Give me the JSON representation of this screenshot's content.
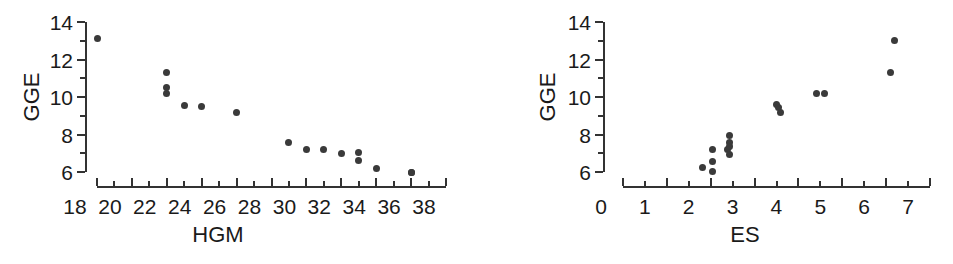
{
  "figure": {
    "background_color": "#ffffff",
    "marker_color": "#3a3a3a",
    "axis_color": "#333333"
  },
  "chart_data": [
    {
      "type": "scatter",
      "panel": "left",
      "title": "",
      "xlabel": "HGM",
      "ylabel": "GGE",
      "xlim": [
        17.2,
        39.0
      ],
      "ylim": [
        5.4,
        14.3
      ],
      "xticks": [
        18,
        20,
        22,
        24,
        26,
        28,
        30,
        32,
        34,
        36,
        38
      ],
      "xtick_labels": [
        "18",
        "20",
        "22",
        "24",
        "26",
        "28",
        "30",
        "32",
        "34",
        "36",
        "38"
      ],
      "xminor_step": 1,
      "yticks": [
        6,
        8,
        10,
        12,
        14
      ],
      "ytick_labels": [
        "6",
        "8",
        "10",
        "12",
        "14"
      ],
      "yminor_step": 1,
      "grid": false,
      "legend": "none",
      "n_points": 16,
      "x": [
        18.0,
        22.0,
        22.0,
        22.0,
        23.0,
        24.0,
        26.0,
        29.0,
        30.0,
        31.0,
        32.0,
        33.0,
        33.0,
        34.0,
        36.0,
        36.0
      ],
      "y": [
        13.1,
        11.3,
        10.5,
        10.2,
        9.55,
        9.5,
        9.15,
        7.55,
        7.2,
        7.2,
        7.0,
        7.05,
        6.6,
        6.2,
        6.0,
        6.0
      ]
    },
    {
      "type": "scatter",
      "panel": "right",
      "title": "",
      "xlabel": "ES",
      "ylabel": "GGE",
      "xlim": [
        -0.2,
        7.3
      ],
      "ylim": [
        5.4,
        14.3
      ],
      "xticks": [
        0,
        1,
        2,
        3,
        4,
        5,
        6,
        7
      ],
      "xtick_labels": [
        "0",
        "1",
        "2",
        "3",
        "4",
        "5",
        "6",
        "7"
      ],
      "xminor_step": 0.5,
      "yticks": [
        6,
        8,
        10,
        12,
        14
      ],
      "ytick_labels": [
        "6",
        "8",
        "10",
        "12",
        "14"
      ],
      "yminor_step": 1,
      "grid": false,
      "legend": "none",
      "n_points": 16,
      "x": [
        1.82,
        2.05,
        2.05,
        2.05,
        2.38,
        2.42,
        2.42,
        2.42,
        2.42,
        3.5,
        3.55,
        3.6,
        4.42,
        4.6,
        6.1,
        6.2
      ],
      "y": [
        6.25,
        7.2,
        6.55,
        6.05,
        7.2,
        7.95,
        7.6,
        7.35,
        6.95,
        9.6,
        9.45,
        9.15,
        10.2,
        10.2,
        11.3,
        13.0
      ]
    }
  ]
}
